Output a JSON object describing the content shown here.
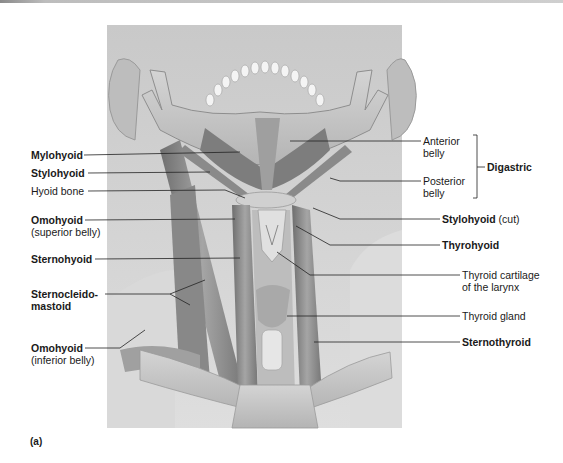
{
  "figure": {
    "panel_label": "(a)",
    "background_color": "#d6d6d6",
    "muscle_color": "#8c8c8c",
    "bone_color": "#c4c4c4",
    "leader_color": "#222222"
  },
  "labels_left": [
    {
      "id": "mylohyoid",
      "text": "Mylohyoid",
      "sub": "",
      "bold": true,
      "x": 31,
      "y": 150
    },
    {
      "id": "stylohyoid",
      "text": "Stylohyoid",
      "sub": "",
      "bold": true,
      "x": 31,
      "y": 168
    },
    {
      "id": "hyoid-bone",
      "text": "Hyoid bone",
      "sub": "",
      "bold": false,
      "x": 31,
      "y": 186
    },
    {
      "id": "omohyoid-superior",
      "text": "Omohyoid",
      "sub": "(superior belly)",
      "bold": true,
      "x": 31,
      "y": 215
    },
    {
      "id": "sternohyoid",
      "text": "Sternohyoid",
      "sub": "",
      "bold": true,
      "x": 31,
      "y": 254
    },
    {
      "id": "sternocleidomastoid",
      "text": "Sternocleido-",
      "sub": "mastoid",
      "bold": true,
      "x": 31,
      "y": 289
    },
    {
      "id": "omohyoid-inferior",
      "text": "Omohyoid",
      "sub": "(inferior belly)",
      "bold": true,
      "x": 31,
      "y": 342
    }
  ],
  "labels_right": [
    {
      "id": "anterior-belly",
      "text": "Anterior",
      "sub": "belly",
      "bold": false,
      "x": 423,
      "y": 136
    },
    {
      "id": "digastric",
      "text": "Digastric",
      "sub": "",
      "bold": true,
      "x": 487,
      "y": 163
    },
    {
      "id": "posterior-belly",
      "text": "Posterior",
      "sub": "belly",
      "bold": false,
      "x": 423,
      "y": 176
    },
    {
      "id": "stylohyoid-cut",
      "text": "Stylohyoid",
      "sub": "",
      "suffix": " (cut)",
      "bold": true,
      "x": 441,
      "y": 214
    },
    {
      "id": "thyrohyoid",
      "text": "Thyrohyoid",
      "sub": "",
      "bold": true,
      "x": 441,
      "y": 240
    },
    {
      "id": "thyroid-cartilage",
      "text": "Thyroid cartilage",
      "sub": "of the larynx",
      "bold": false,
      "x": 461,
      "y": 269
    },
    {
      "id": "thyroid-gland",
      "text": "Thyroid gland",
      "sub": "",
      "bold": false,
      "x": 461,
      "y": 310
    },
    {
      "id": "sternothyroid",
      "text": "Sternothyroid",
      "sub": "",
      "bold": true,
      "x": 461,
      "y": 336
    }
  ]
}
